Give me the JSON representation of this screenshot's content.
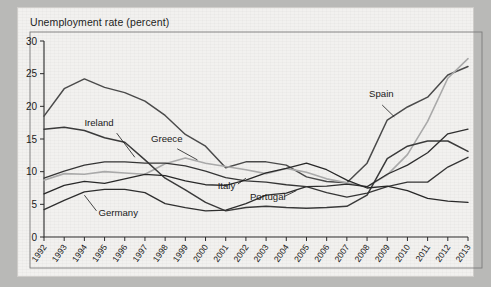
{
  "chart_data": {
    "type": "line",
    "title": "Unemployment rate (percent)",
    "xlabel": "",
    "ylabel": "",
    "ylim": [
      0,
      30
    ],
    "yticks": [
      0,
      5,
      10,
      15,
      20,
      25,
      30
    ],
    "grid": false,
    "legend": "inline-labels",
    "x": [
      1992,
      1993,
      1994,
      1995,
      1996,
      1997,
      1998,
      1999,
      2000,
      2001,
      2002,
      2003,
      2004,
      2005,
      2006,
      2007,
      2008,
      2009,
      2010,
      2011,
      2012,
      2013
    ],
    "categories": [
      "1992",
      "1993",
      "1994",
      "1995",
      "1996",
      "1997",
      "1998",
      "1999",
      "2000",
      "2001",
      "2002",
      "2003",
      "2004",
      "2005",
      "2006",
      "2007",
      "2008",
      "2009",
      "2010",
      "2011",
      "2012",
      "2013"
    ],
    "series": [
      {
        "name": "Spain",
        "color": "#4a4a4a",
        "width": 1.5,
        "label_x": 2008.1,
        "label_y": 21.4,
        "leader": [
          [
            2008.75,
            20.2
          ],
          [
            2009.35,
            18.4
          ]
        ],
        "values": [
          18.5,
          22.7,
          24.2,
          22.9,
          22.1,
          20.8,
          18.6,
          15.7,
          13.9,
          10.6,
          11.5,
          11.5,
          11.0,
          9.2,
          8.5,
          8.3,
          11.3,
          17.9,
          19.9,
          21.4,
          24.8,
          26.1
        ]
      },
      {
        "name": "Greece",
        "color": "#a9a9a9",
        "width": 1.6,
        "label_x": 1997.3,
        "label_y": 14.5,
        "leader": [
          [
            1998.6,
            13.5
          ],
          [
            1999.6,
            11.8
          ]
        ],
        "values": [
          8.7,
          9.7,
          9.6,
          10.0,
          9.8,
          9.6,
          11.2,
          12.1,
          11.3,
          10.8,
          10.3,
          9.7,
          10.5,
          9.9,
          8.9,
          8.3,
          7.7,
          9.5,
          12.6,
          17.7,
          24.3,
          27.3
        ]
      },
      {
        "name": "Ireland",
        "color": "#3a3a3a",
        "width": 1.5,
        "label_x": 1994.0,
        "label_y": 17.0,
        "leader": [
          [
            1995.6,
            15.9
          ],
          [
            1996.5,
            12.2
          ]
        ],
        "values": [
          16.5,
          16.8,
          16.3,
          15.2,
          14.5,
          11.8,
          9.0,
          7.2,
          5.3,
          4.0,
          4.5,
          4.7,
          4.5,
          4.4,
          4.5,
          4.7,
          6.4,
          12.0,
          13.9,
          14.7,
          14.7,
          13.1
        ]
      },
      {
        "name": "Portugal",
        "color": "#2e2e2e",
        "width": 1.3,
        "label_x": 2002.2,
        "label_y": 5.6,
        "leader": [
          [
            2003.9,
            6.2
          ],
          [
            2004.5,
            7.1
          ]
        ],
        "values": [
          4.2,
          5.6,
          6.9,
          7.3,
          7.3,
          6.8,
          5.1,
          4.5,
          4.0,
          4.1,
          5.1,
          6.4,
          6.7,
          7.7,
          7.8,
          8.1,
          7.7,
          9.6,
          11.0,
          12.9,
          15.8,
          16.5
        ]
      },
      {
        "name": "Italy",
        "color": "#353535",
        "width": 1.3,
        "label_x": 2000.6,
        "label_y": 7.3,
        "leader": [
          [
            2001.6,
            8.1
          ],
          [
            2002.0,
            9.0
          ]
        ],
        "values": [
          9.0,
          10.1,
          11.0,
          11.5,
          11.5,
          11.3,
          11.3,
          10.9,
          10.1,
          9.1,
          8.6,
          8.4,
          8.0,
          7.7,
          6.8,
          6.1,
          6.7,
          7.7,
          8.4,
          8.4,
          10.7,
          12.2
        ]
      },
      {
        "name": "Germany",
        "color": "#282828",
        "width": 1.3,
        "label_x": 1994.7,
        "label_y": 3.2,
        "leader": [
          [
            1994.6,
            4.0
          ],
          [
            1994.0,
            6.4
          ]
        ],
        "values": [
          6.6,
          7.9,
          8.5,
          8.2,
          8.9,
          9.6,
          9.4,
          8.6,
          8.0,
          7.9,
          8.7,
          9.8,
          10.5,
          11.3,
          10.3,
          8.7,
          7.5,
          7.8,
          7.1,
          5.9,
          5.5,
          5.3
        ]
      }
    ]
  }
}
